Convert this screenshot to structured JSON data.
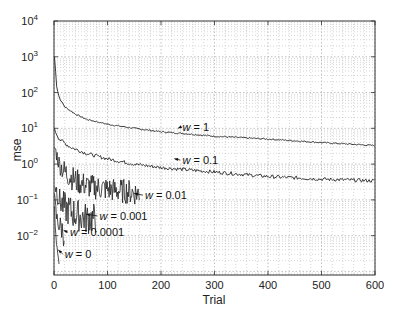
{
  "chart_data": {
    "type": "line",
    "title": "",
    "xlabel": "Trial",
    "ylabel": "mse",
    "xlim": [
      0,
      600
    ],
    "ylim_log10": [
      -3.1,
      4
    ],
    "yscale": "log",
    "grid": true,
    "x_ticks": [
      "0",
      "100",
      "200",
      "300",
      "400",
      "500",
      "600"
    ],
    "y_ticks": [
      {
        "base": "10",
        "exp": "4"
      },
      {
        "base": "10",
        "exp": "3"
      },
      {
        "base": "10",
        "exp": "2"
      },
      {
        "base": "10",
        "exp": "1"
      },
      {
        "base": "10",
        "exp": "0"
      },
      {
        "base": "10",
        "exp": "−1"
      },
      {
        "base": "10",
        "exp": "−2"
      }
    ],
    "series": [
      {
        "name": "w = 1",
        "x": [
          1,
          5,
          10,
          20,
          40,
          60,
          100,
          150,
          200,
          250,
          300,
          400,
          500,
          600
        ],
        "values": [
          1000,
          150,
          70,
          40,
          25,
          18,
          13,
          10,
          8,
          7,
          6,
          5,
          4,
          3.3
        ]
      },
      {
        "name": "w = 0.1",
        "x": [
          1,
          10,
          30,
          60,
          100,
          150,
          200,
          300,
          400,
          500,
          600
        ],
        "values": [
          9,
          5,
          3,
          2,
          1.4,
          1.0,
          0.8,
          0.6,
          0.45,
          0.38,
          0.34
        ]
      },
      {
        "name": "w = 0.01",
        "x": [
          1,
          10,
          20,
          40,
          60,
          80,
          100,
          120,
          140,
          160
        ],
        "values": [
          3,
          1.0,
          0.6,
          0.35,
          0.25,
          0.22,
          0.2,
          0.18,
          0.17,
          0.15
        ]
      },
      {
        "name": "w = 0.001",
        "x": [
          1,
          10,
          20,
          40,
          60,
          80
        ],
        "values": [
          0.3,
          0.1,
          0.06,
          0.04,
          0.03,
          0.03
        ]
      },
      {
        "name": "w = 0.0001",
        "x": [
          1,
          5,
          10,
          15,
          20
        ],
        "values": [
          0.1,
          0.03,
          0.02,
          0.015,
          0.01
        ]
      },
      {
        "name": "w = 0",
        "x": [
          1,
          3,
          6,
          10
        ],
        "values": [
          0.05,
          0.01,
          0.003,
          0.001
        ]
      }
    ],
    "annotations": [
      {
        "text": "w = 1",
        "label_x": 240,
        "label_y_log": 0.92
      },
      {
        "text": "w = 0.1",
        "label_x": 240,
        "label_y_log": 0.0
      },
      {
        "text": "w = 0.01",
        "label_x": 170,
        "label_y_log": -0.98
      },
      {
        "text": "w = 0.001",
        "label_x": 85,
        "label_y_log": -1.56
      },
      {
        "text": "w = 0.0001",
        "label_x": 30,
        "label_y_log": -2.02
      },
      {
        "text": "w = 0",
        "label_x": 20,
        "label_y_log": -2.62
      }
    ]
  }
}
